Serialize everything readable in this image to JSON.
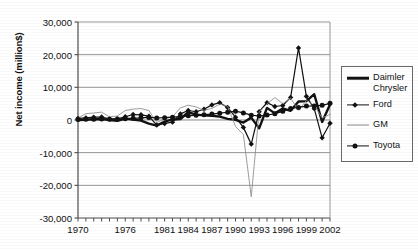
{
  "chart_data": {
    "type": "line",
    "title": "",
    "subtitle": "",
    "xlabel": "",
    "ylabel": "Net income (million$)",
    "xlim": [
      1970,
      2002
    ],
    "ylim": [
      -30000,
      30000
    ],
    "grid": true,
    "legend_position": "right",
    "y_ticks": [
      "30,000",
      "20,000",
      "10,000",
      "0",
      "-10,000",
      "-20,000",
      "-30,000"
    ],
    "y_tick_values": [
      30000,
      20000,
      10000,
      0,
      -10000,
      -20000,
      -30000
    ],
    "x_tick_labels": [
      "1970",
      "1976",
      "1981",
      "1984",
      "1987",
      "1990",
      "1993",
      "1996",
      "1999",
      "2002"
    ],
    "x_tick_label_values": [
      1970,
      1976,
      1981,
      1984,
      1987,
      1990,
      1993,
      1996,
      1999,
      2002
    ],
    "x": [
      1970,
      1971,
      1972,
      1973,
      1974,
      1975,
      1976,
      1977,
      1978,
      1979,
      1980,
      1981,
      1982,
      1983,
      1984,
      1985,
      1986,
      1987,
      1988,
      1989,
      1990,
      1991,
      1992,
      1993,
      1994,
      1995,
      1996,
      1997,
      1998,
      1999,
      2000,
      2001,
      2002
    ],
    "series": [
      {
        "name": "Daimler Chrysler",
        "marker": "none",
        "line_style": "thick-solid",
        "color": "#111111",
        "values": [
          -7,
          84,
          220,
          255,
          -52,
          -260,
          423,
          163,
          -205,
          -1097,
          -1710,
          -476,
          170,
          302,
          2380,
          1635,
          1404,
          1290,
          1050,
          359,
          68,
          -795,
          723,
          -2551,
          3713,
          2025,
          3529,
          2805,
          5656,
          5785,
          7894,
          -589,
          4718
        ]
      },
      {
        "name": "Ford",
        "marker": "diamond",
        "line_style": "solid",
        "color": "#111111",
        "values": [
          516,
          657,
          870,
          906,
          361,
          323,
          983,
          1673,
          1589,
          1169,
          -1543,
          -1060,
          -658,
          1867,
          2907,
          2515,
          3285,
          4625,
          5300,
          3835,
          860,
          -2258,
          -7385,
          2529,
          5308,
          4139,
          4446,
          6920,
          22071,
          7237,
          3467,
          -5453,
          -980
        ]
      },
      {
        "name": "GM",
        "marker": "none",
        "line_style": "thin-solid",
        "color": "#8c8c8c",
        "values": [
          609,
          1936,
          2163,
          2398,
          950,
          1253,
          2903,
          3338,
          3508,
          2893,
          -763,
          333,
          963,
          3730,
          4517,
          3999,
          2945,
          3551,
          4856,
          4224,
          -1986,
          -4453,
          -23498,
          2466,
          4901,
          6881,
          4963,
          6698,
          2956,
          6002,
          4452,
          601,
          1736
        ]
      },
      {
        "name": "Toyota",
        "marker": "circle",
        "line_style": "solid",
        "color": "#111111",
        "values": [
          180,
          205,
          240,
          310,
          255,
          290,
          420,
          520,
          660,
          790,
          640,
          720,
          870,
          1010,
          1290,
          1450,
          1630,
          1820,
          2100,
          2380,
          2700,
          2180,
          1480,
          1230,
          1510,
          1910,
          2660,
          3530,
          3860,
          4270,
          4320,
          4500,
          5100
        ]
      }
    ]
  },
  "legend": {
    "entries": [
      {
        "label_line1": "Daimler",
        "label_line2": "Chrysler",
        "sample": "thick-line"
      },
      {
        "label_line1": "Ford",
        "label_line2": "",
        "sample": "line-diamond"
      },
      {
        "label_line1": "GM",
        "label_line2": "",
        "sample": "thin-gray-line"
      },
      {
        "label_line1": "Toyota",
        "label_line2": "",
        "sample": "line-circle"
      }
    ]
  },
  "colors": {
    "axis": "#4d4d4d",
    "grid": "#8a8a8a",
    "dark_series": "#111111",
    "gray_series": "#8c8c8c",
    "background": "#ffffff"
  }
}
